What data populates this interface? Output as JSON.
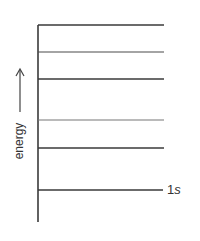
{
  "diagram": {
    "type": "energy-level-diagram",
    "axis": {
      "label": "energy",
      "arrow": "up"
    },
    "line_color": "#3a3a3a",
    "levels": [
      {
        "y": 25,
        "label": ""
      },
      {
        "y": 52,
        "label": ""
      },
      {
        "y": 79,
        "label": ""
      },
      {
        "y": 120,
        "label": ""
      },
      {
        "y": 148,
        "label": ""
      },
      {
        "y": 190,
        "label": "1s",
        "label_num": "1",
        "label_orbital": "s"
      }
    ]
  }
}
